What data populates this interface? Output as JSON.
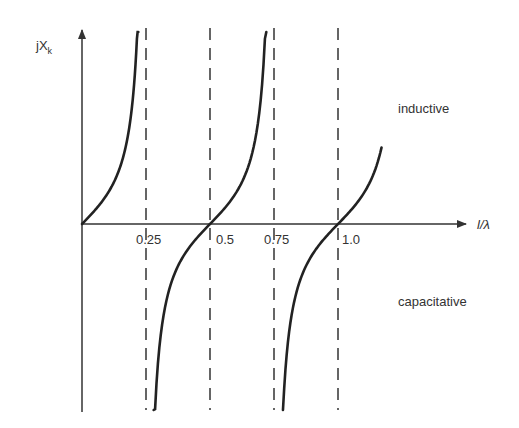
{
  "chart_data": {
    "type": "line",
    "title": "",
    "xlabel": "l/λ",
    "ylabel": "jX",
    "ylabel_subscript": "k",
    "xlim": [
      0,
      1.45
    ],
    "ylim": [
      -4.5,
      4.5
    ],
    "x_ticks": [
      {
        "value": 0.25,
        "label": "0.25"
      },
      {
        "value": 0.5,
        "label": "0.5"
      },
      {
        "value": 0.75,
        "label": "0.75"
      },
      {
        "value": 1.0,
        "label": "1.0"
      }
    ],
    "asymptotes": [
      0.25,
      0.5,
      0.75,
      1.0
    ],
    "function": "tan(2*pi*l/lambda)",
    "series": [
      {
        "name": "branch-1",
        "x_range": [
          0.0,
          0.22
        ]
      },
      {
        "name": "branch-2",
        "x_range": [
          0.28,
          0.72
        ]
      },
      {
        "name": "branch-3",
        "x_range": [
          0.785,
          1.17
        ]
      }
    ],
    "annotations": [
      {
        "text": "inductive",
        "region": "upper-right"
      },
      {
        "text": "capacitative",
        "region": "lower-right"
      }
    ],
    "grid": false,
    "legend": "none",
    "colors": {
      "curve": "#222222",
      "axis": "#333333",
      "dash": "#333333",
      "text": "#333333"
    }
  }
}
